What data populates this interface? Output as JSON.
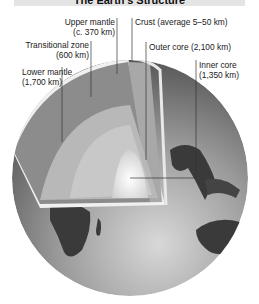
{
  "title": "The Earth's Structure",
  "labels": {
    "upper_mantle": {
      "name": "Upper mantle",
      "depth": "(c. 370 km)"
    },
    "crust": {
      "name": "Crust (average 5–50 km)"
    },
    "transitional_zone": {
      "name": "Transitional zone",
      "depth": "(600 km)"
    },
    "outer_core": {
      "name": "Outer core (2,100 km)"
    },
    "lower_mantle": {
      "name": "Lower mantle",
      "depth": "(1,700 km)"
    },
    "inner_core": {
      "name": "Inner core",
      "depth": "(1,350 km)"
    }
  },
  "colors": {
    "title_bar": "#e4e4e4",
    "globe_dark": "#3a3a3a",
    "globe_light": "#cfcfcf",
    "inner_core": "#ffffff"
  }
}
